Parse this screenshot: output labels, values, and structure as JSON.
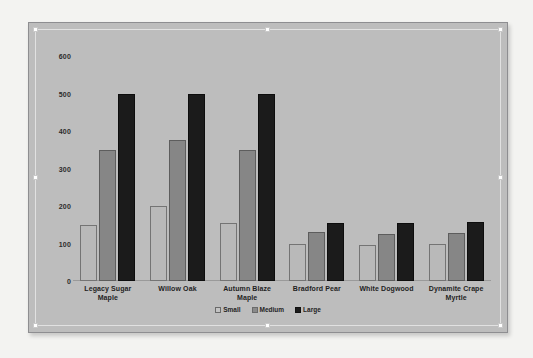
{
  "chart_object": {
    "selected": true,
    "handles": [
      "top-left",
      "top-center",
      "top-right",
      "middle-left",
      "middle-right",
      "bottom-left",
      "bottom-center",
      "bottom-right"
    ],
    "background_color": "#bdbdbd",
    "border_color": "#8e8e91"
  },
  "chart_data": {
    "type": "bar",
    "title": "",
    "subtitle": "",
    "xlabel": "",
    "ylabel": "",
    "grid": false,
    "legend_position": "bottom",
    "ylim": [
      0,
      600
    ],
    "yticks": [
      0,
      100,
      200,
      300,
      400,
      500,
      600
    ],
    "ytick_labels": [
      "0",
      "100",
      "200",
      "300",
      "400",
      "500",
      "600"
    ],
    "categories": [
      "Legacy Sugar Maple",
      "Willow Oak",
      "Autumn Blaze Maple",
      "Bradford Pear",
      "White Dogwood",
      "Dynamite Crape Myrtle"
    ],
    "category_lines": [
      [
        "Legacy Sugar",
        "Maple"
      ],
      [
        "Willow Oak"
      ],
      [
        "Autumn Blaze",
        "Maple"
      ],
      [
        "Bradford Pear"
      ],
      [
        "White Dogwood"
      ],
      [
        "Dynamite Crape",
        "Myrtle"
      ]
    ],
    "series": [
      {
        "name": "Small",
        "color": "#b9b9b9",
        "values": [
          150,
          200,
          155,
          100,
          95,
          98
        ]
      },
      {
        "name": "Medium",
        "color": "#868686",
        "values": [
          350,
          375,
          350,
          130,
          125,
          128
        ]
      },
      {
        "name": "Large",
        "color": "#1b1b1b",
        "values": [
          500,
          500,
          500,
          155,
          155,
          158
        ]
      }
    ]
  }
}
